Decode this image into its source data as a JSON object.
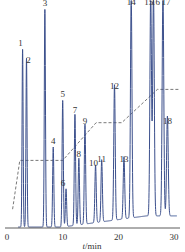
{
  "chart_data": {
    "type": "line",
    "title": "",
    "xlabel": "t/min",
    "ylabel": "",
    "xlim": [
      0,
      31
    ],
    "xticks": [
      0,
      10,
      20,
      30
    ],
    "grid": false,
    "legend": null,
    "colors": {
      "trace": "#3b4f8c",
      "gradient": "#555555",
      "axis": "#333333"
    },
    "peaks": [
      {
        "label": "1",
        "t": 2.8,
        "height": 0.8
      },
      {
        "label": "2",
        "t": 3.5,
        "height": 0.76
      },
      {
        "label": "3",
        "t": 6.8,
        "height": 0.98
      },
      {
        "label": "4",
        "t": 8.3,
        "height": 0.36
      },
      {
        "label": "5",
        "t": 10.0,
        "height": 0.57
      },
      {
        "label": "6",
        "t": 10.6,
        "height": 0.17
      },
      {
        "label": "7",
        "t": 12.2,
        "height": 0.5
      },
      {
        "label": "8",
        "t": 12.9,
        "height": 0.3
      },
      {
        "label": "9",
        "t": 14.0,
        "height": 0.45
      },
      {
        "label": "10",
        "t": 15.9,
        "height": 0.26
      },
      {
        "label": "11",
        "t": 17.0,
        "height": 0.28
      },
      {
        "label": "12",
        "t": 19.3,
        "height": 0.61
      },
      {
        "label": "13",
        "t": 21.0,
        "height": 0.28
      },
      {
        "label": "14",
        "t": 22.3,
        "height": 1.0
      },
      {
        "label": "15",
        "t": 25.8,
        "height": 1.0
      },
      {
        "label": "16",
        "t": 26.3,
        "height": 1.0
      },
      {
        "label": "17",
        "t": 28.0,
        "height": 1.0
      },
      {
        "label": "18",
        "t": 28.8,
        "height": 0.45
      }
    ],
    "gradient_profile": {
      "style": "dashed",
      "points": [
        [
          1.0,
          0.08
        ],
        [
          2.3,
          0.3
        ],
        [
          10.0,
          0.3
        ],
        [
          16.0,
          0.47
        ],
        [
          20.6,
          0.47
        ],
        [
          27.0,
          0.62
        ],
        [
          31.0,
          0.62
        ]
      ]
    }
  }
}
